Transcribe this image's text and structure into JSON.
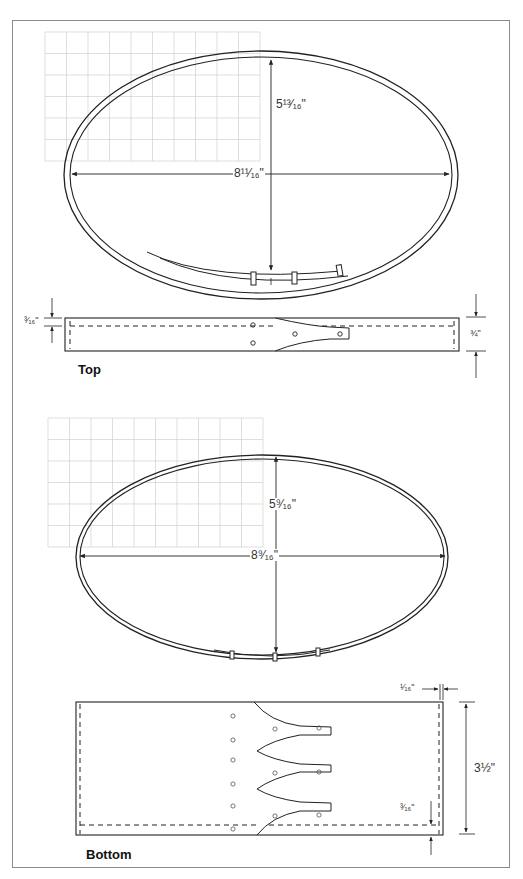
{
  "figure": {
    "frame_color": "#8a8a8a",
    "line_color": "#222222",
    "grid_color": "#d0d0d0"
  },
  "top": {
    "title": "Top",
    "grid": {
      "x": 45,
      "y": 32,
      "cols": 10,
      "rows": 6,
      "cell": 21.5
    },
    "ellipse": {
      "cx": 261,
      "cy": 175,
      "outer_rx": 197,
      "outer_ry": 124,
      "inner_rx": 191,
      "inner_ry": 118
    },
    "labels": {
      "height_dim": "5¹³⁄₁₆\"",
      "width_dim": "8¹¹⁄₁₆\"",
      "strip_thickness": "³⁄₁₆\"",
      "strip_height": "¾\""
    }
  },
  "bottom": {
    "title": "Bottom",
    "grid": {
      "x": 48,
      "y": 418,
      "cols": 10,
      "rows": 6,
      "cell": 21.5
    },
    "ellipse": {
      "cx": 262,
      "cy": 557,
      "outer_rx": 186,
      "outer_ry": 102,
      "inner_rx": 182,
      "inner_ry": 98
    },
    "labels": {
      "height_dim": "5⁹⁄₁₆\"",
      "width_dim": "8⁹⁄₁₆\"",
      "edge_offset": "¹⁄₁₆\"",
      "strip_height": "3½\"",
      "strip_thickness": "³⁄₁₆\""
    }
  }
}
